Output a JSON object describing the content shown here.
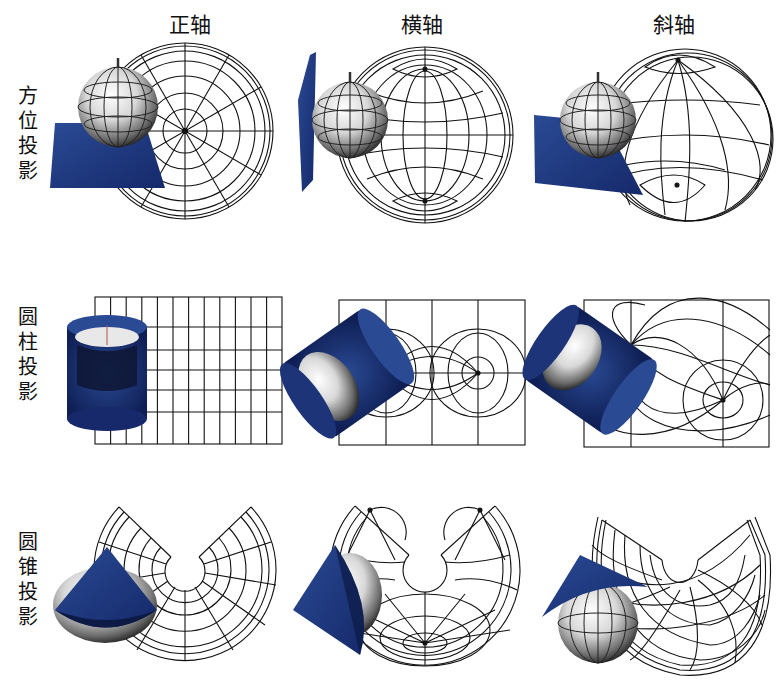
{
  "columns": [
    {
      "label": "正轴",
      "x": 190
    },
    {
      "label": "横轴",
      "x": 422
    },
    {
      "label": "斜轴",
      "x": 674
    }
  ],
  "rows": [
    {
      "label_chars": [
        "方",
        "位",
        "投",
        "影"
      ],
      "top": 84
    },
    {
      "label_chars": [
        "圆",
        "柱",
        "投",
        "影"
      ],
      "top": 305
    },
    {
      "label_chars": [
        "圆",
        "锥",
        "投",
        "影"
      ],
      "top": 530
    }
  ],
  "colors": {
    "surface_blue": "#1f3a7e",
    "surface_dark": "#0c1a45",
    "grid_line": "#111111",
    "globe_light": "#f2f2f2",
    "globe_dark": "#1a1a1a"
  },
  "cells": [
    {
      "id": "azimuthal-normal",
      "projection": "方位投影",
      "aspect": "正轴"
    },
    {
      "id": "azimuthal-transverse",
      "projection": "方位投影",
      "aspect": "横轴"
    },
    {
      "id": "azimuthal-oblique",
      "projection": "方位投影",
      "aspect": "斜轴"
    },
    {
      "id": "cylindrical-normal",
      "projection": "圆柱投影",
      "aspect": "正轴"
    },
    {
      "id": "cylindrical-transverse",
      "projection": "圆柱投影",
      "aspect": "横轴"
    },
    {
      "id": "cylindrical-oblique",
      "projection": "圆柱投影",
      "aspect": "斜轴"
    },
    {
      "id": "conic-normal",
      "projection": "圆锥投影",
      "aspect": "正轴"
    },
    {
      "id": "conic-transverse",
      "projection": "圆锥投影",
      "aspect": "横轴"
    },
    {
      "id": "conic-oblique",
      "projection": "圆锥投影",
      "aspect": "斜轴"
    }
  ]
}
